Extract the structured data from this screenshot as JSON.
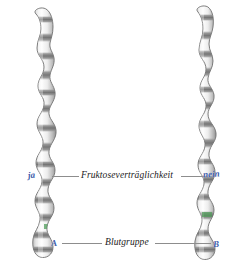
{
  "figure": {
    "name": "homologous-chromosome-pair-gene-loci",
    "background_color": "#ffffff",
    "width": 251,
    "height": 268
  },
  "colors": {
    "allele_text": "#3a5aa8",
    "leader_line": "#8d8d8d",
    "trait_text": "#1a1a1a",
    "chromosome_outline": "#6f6f6f",
    "chromosome_band_dark": "#8a8a8a",
    "chromosome_band_light": "#ffffff",
    "locus_marker_green": "#4f9e59"
  },
  "traits": [
    {
      "id": "fruktoseliste",
      "name": "Fruktoseverträglichkeit",
      "label": "Fruktoseverträglichkeit",
      "left_allele": "ja",
      "right_allele": "nein"
    },
    {
      "id": "blutgruppe",
      "name": "Blutgruppe",
      "label": "Blutgruppe",
      "left_allele": "A",
      "right_allele": "B"
    }
  ],
  "chromosomes": [
    {
      "side": "left",
      "name": "chromosome-left",
      "alleles": [
        "ja",
        "A"
      ]
    },
    {
      "side": "right",
      "name": "chromosome-right",
      "alleles": [
        "nein",
        "B"
      ]
    }
  ]
}
